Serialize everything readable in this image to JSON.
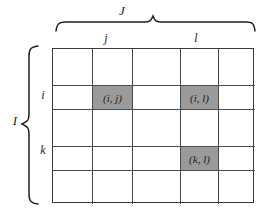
{
  "figure": {
    "name": "matrix-index-diagram",
    "grid": {
      "columns": 5,
      "rows": 5,
      "cells": [
        [
          {
            "label": "",
            "shaded": false
          },
          {
            "label": "",
            "shaded": false
          },
          {
            "label": "",
            "shaded": false
          },
          {
            "label": "",
            "shaded": false
          },
          {
            "label": "",
            "shaded": false
          }
        ],
        [
          {
            "label": "",
            "shaded": false
          },
          {
            "label": "(i, j)",
            "shaded": true
          },
          {
            "label": "",
            "shaded": false
          },
          {
            "label": "(i, l)",
            "shaded": true
          },
          {
            "label": "",
            "shaded": false
          }
        ],
        [
          {
            "label": "",
            "shaded": false
          },
          {
            "label": "",
            "shaded": false
          },
          {
            "label": "",
            "shaded": false
          },
          {
            "label": "",
            "shaded": false
          },
          {
            "label": "",
            "shaded": false
          }
        ],
        [
          {
            "label": "",
            "shaded": false
          },
          {
            "label": "",
            "shaded": false
          },
          {
            "label": "",
            "shaded": false
          },
          {
            "label": "(k, l)",
            "shaded": true
          },
          {
            "label": "",
            "shaded": false
          }
        ],
        [
          {
            "label": "",
            "shaded": false
          },
          {
            "label": "",
            "shaded": false
          },
          {
            "label": "",
            "shaded": false
          },
          {
            "label": "",
            "shaded": false
          },
          {
            "label": "",
            "shaded": false
          }
        ]
      ]
    },
    "annotations": {
      "column_group_label": "J",
      "row_group_label": "I",
      "column_labels": {
        "second": "j",
        "fourth": "l"
      },
      "row_labels": {
        "second": "i",
        "fourth": "k"
      }
    },
    "colors": {
      "shaded_cell": "#9a9a9a",
      "grid_line": "#4a4a4a",
      "frame": "#3a3a3a",
      "text": "#1a1a1a",
      "background": "#ffffff"
    }
  }
}
